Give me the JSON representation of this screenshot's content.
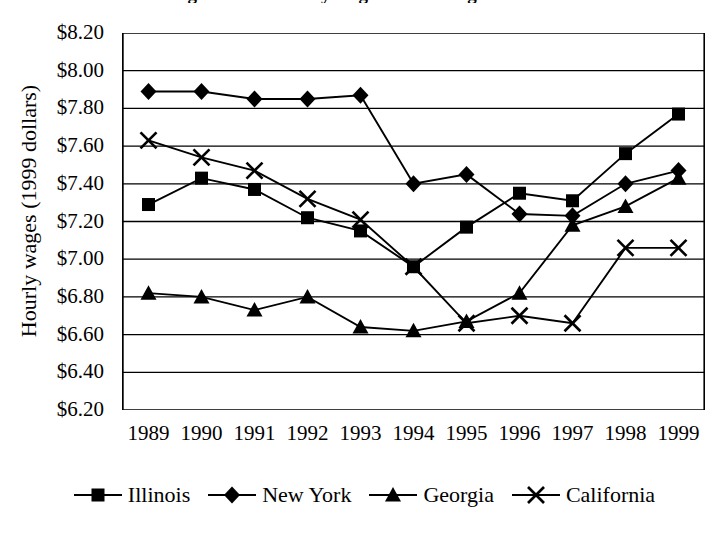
{
  "figure": {
    "title_cut_off": "Figure: Real hourly wages of low-wage workers",
    "y_axis_title": "Hourly wages (1999 dollars)"
  },
  "chart_data": {
    "type": "line",
    "title": "",
    "xlabel": "",
    "ylabel": "Hourly wages (1999 dollars)",
    "ylim": [
      6.2,
      8.2
    ],
    "ytick_step": 0.2,
    "grid": true,
    "legend_position": "bottom",
    "categories": [
      "1989",
      "1990",
      "1991",
      "1992",
      "1993",
      "1994",
      "1995",
      "1996",
      "1997",
      "1998",
      "1999"
    ],
    "ytick_labels": [
      "$8.20",
      "$8.00",
      "$7.80",
      "$7.60",
      "$7.40",
      "$7.20",
      "$7.00",
      "$6.80",
      "$6.60",
      "$6.40",
      "$6.20"
    ],
    "series": [
      {
        "name": "Illinois",
        "marker": "square",
        "color": "#000000",
        "values": [
          7.29,
          7.43,
          7.37,
          7.22,
          7.15,
          6.96,
          7.17,
          7.35,
          7.31,
          7.56,
          7.77
        ]
      },
      {
        "name": "New York",
        "marker": "diamond",
        "color": "#000000",
        "values": [
          7.89,
          7.89,
          7.85,
          7.85,
          7.87,
          7.4,
          7.45,
          7.24,
          7.23,
          7.4,
          7.47
        ]
      },
      {
        "name": "Georgia",
        "marker": "triangle",
        "color": "#000000",
        "values": [
          6.82,
          6.8,
          6.73,
          6.8,
          6.64,
          6.62,
          6.67,
          6.82,
          7.18,
          7.28,
          7.43
        ]
      },
      {
        "name": "California",
        "marker": "cross",
        "color": "#000000",
        "values": [
          7.63,
          7.54,
          7.47,
          7.32,
          7.21,
          6.96,
          6.66,
          6.7,
          6.66,
          7.06,
          7.06
        ]
      }
    ]
  },
  "legend": {
    "items": [
      {
        "label": "Illinois",
        "marker": "square-marker-icon"
      },
      {
        "label": "New York",
        "marker": "diamond-marker-icon"
      },
      {
        "label": "Georgia",
        "marker": "triangle-marker-icon"
      },
      {
        "label": "California",
        "marker": "cross-marker-icon"
      }
    ]
  }
}
